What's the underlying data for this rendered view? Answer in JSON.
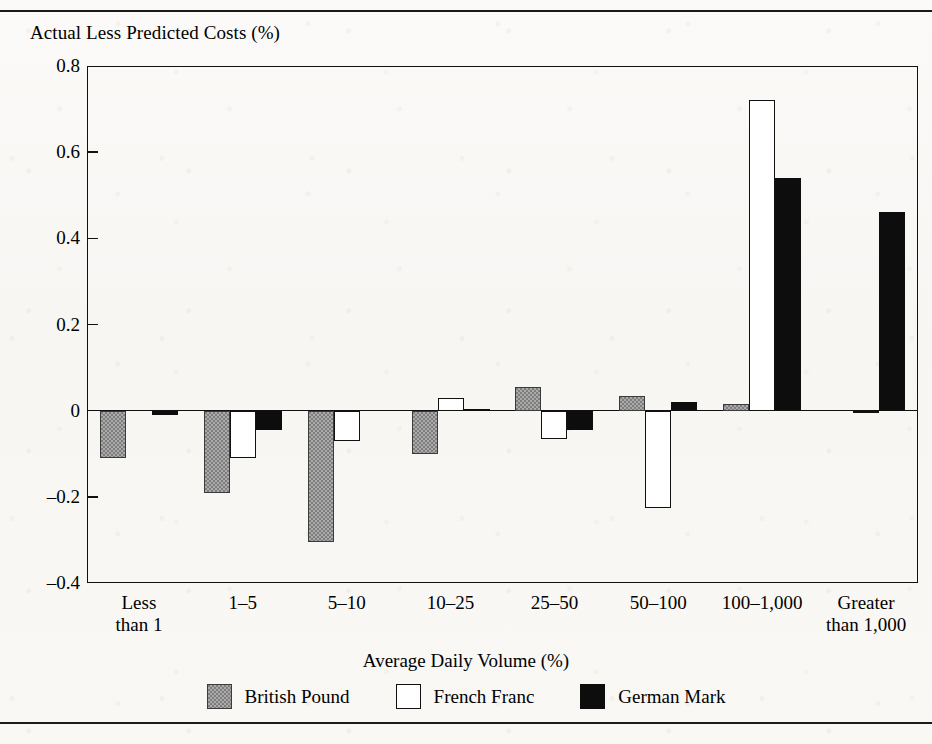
{
  "figure": {
    "y_axis_title": "Actual Less Predicted Costs (%)",
    "x_axis_title": "Average Daily Volume (%)"
  },
  "legend": {
    "items": [
      {
        "label": "British Pound",
        "swatch": "gray",
        "color": "#7e7e7e"
      },
      {
        "label": "French Franc",
        "swatch": "white",
        "color": "#ffffff"
      },
      {
        "label": "German Mark",
        "swatch": "black",
        "color": "#0d0d0d"
      }
    ]
  },
  "y_ticks": [
    {
      "label": "0.8",
      "value": 0.8
    },
    {
      "label": "0.6",
      "value": 0.6
    },
    {
      "label": "0.4",
      "value": 0.4
    },
    {
      "label": "0.2",
      "value": 0.2
    },
    {
      "label": "0",
      "value": 0
    },
    {
      "label": "-0.2",
      "value": -0.2
    },
    {
      "label": "-0.4",
      "value": -0.4
    }
  ],
  "categories": [
    {
      "line1": "Less",
      "line2": "than 1"
    },
    {
      "line1": "1–5",
      "line2": ""
    },
    {
      "line1": "5–10",
      "line2": ""
    },
    {
      "line1": "10–25",
      "line2": ""
    },
    {
      "line1": "25–50",
      "line2": ""
    },
    {
      "line1": "50–100",
      "line2": ""
    },
    {
      "line1": "100–1,000",
      "line2": ""
    },
    {
      "line1": "Greater",
      "line2": "than 1,000"
    }
  ],
  "chart_data": {
    "type": "bar",
    "title": "",
    "xlabel": "Average Daily Volume (%)",
    "ylabel": "Actual Less Predicted Costs (%)",
    "ylim": [
      -0.4,
      0.8
    ],
    "ytick_values": [
      0.8,
      0.6,
      0.4,
      0.2,
      0,
      -0.2,
      -0.4
    ],
    "grid": false,
    "legend_position": "bottom",
    "categories": [
      "Less than 1",
      "1–5",
      "5–10",
      "10–25",
      "25–50",
      "50–100",
      "100–1,000",
      "Greater than 1,000"
    ],
    "series": [
      {
        "name": "British Pound",
        "color": "#7e7e7e",
        "values": [
          -0.11,
          -0.19,
          -0.305,
          -0.1,
          0.055,
          0.035,
          0.015,
          0.0
        ]
      },
      {
        "name": "French Franc",
        "color": "#ffffff",
        "values": [
          0.0,
          -0.11,
          -0.07,
          0.03,
          -0.065,
          -0.225,
          0.72,
          -0.005
        ]
      },
      {
        "name": "German Mark",
        "color": "#0d0d0d",
        "values": [
          -0.01,
          -0.045,
          0.0,
          0.005,
          -0.045,
          0.02,
          0.54,
          0.46
        ]
      }
    ]
  }
}
